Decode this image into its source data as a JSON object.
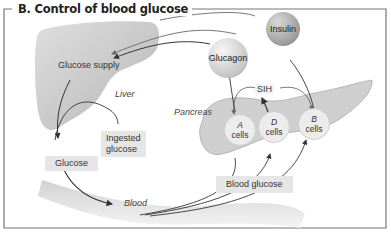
{
  "figure": {
    "title": "B.  Control of blood glucose"
  },
  "organs": {
    "liver": "Liver",
    "pancreas": "Pancreas",
    "blood": "Blood"
  },
  "hormones": {
    "glucagon": "Glucagon",
    "insulin": "Insulin",
    "sih": "SIH"
  },
  "cells": [
    {
      "letter": "A",
      "label": "cells"
    },
    {
      "letter": "D",
      "label": "cells"
    },
    {
      "letter": "B",
      "label": "cells"
    }
  ],
  "boxes": {
    "glucose_supply": "Glucose supply",
    "ingested_line1": "Ingested",
    "ingested_line2": "glucose",
    "glucose": "Glucose",
    "blood_glucose": "Blood glucose"
  },
  "colors": {
    "frame": "#555555",
    "liver": "#c4c4c4",
    "box_bg": "#e6e6e6",
    "arrow": "#333333"
  }
}
